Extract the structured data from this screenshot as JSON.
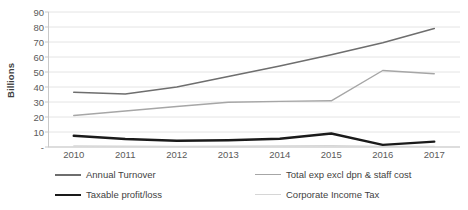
{
  "chart_data": {
    "type": "line",
    "title": "",
    "xlabel": "",
    "ylabel": "Billions",
    "ylim": [
      0,
      90
    ],
    "ytick_step": 10,
    "grid": true,
    "legend_position": "bottom",
    "zero_tick_label": "-",
    "categories": [
      "2010",
      "2011",
      "2012",
      "2013",
      "2014",
      "2015",
      "2016",
      "2017"
    ],
    "yticks": [
      "90",
      "80",
      "70",
      "60",
      "50",
      "40",
      "30",
      "20",
      "10",
      "-"
    ],
    "series": [
      {
        "name": "Annual Turnover",
        "color": "#6e6e6e",
        "width": 1.6,
        "values": [
          36.5,
          35.3,
          40.0,
          47.0,
          54.0,
          61.5,
          69.5,
          79.0
        ]
      },
      {
        "name": "Total exp excl dpn & staff cost",
        "color": "#a6a6a6",
        "width": 1.4,
        "values": [
          21.0,
          24.0,
          27.0,
          29.8,
          30.4,
          30.8,
          51.0,
          48.8
        ]
      },
      {
        "name": "Taxable profit/loss",
        "color": "#1a1a1a",
        "width": 2.4,
        "values": [
          7.5,
          5.3,
          4.2,
          4.5,
          5.5,
          9.0,
          1.4,
          3.6
        ]
      },
      {
        "name": "Corporate Income Tax",
        "color": "#d6d6d6",
        "width": 1.2,
        "values": [
          0.7,
          0.6,
          0.5,
          0.6,
          0.7,
          0.9,
          0.4,
          0.5
        ]
      }
    ]
  },
  "legend": {
    "items": [
      {
        "label": "Annual Turnover"
      },
      {
        "label": "Total exp excl dpn & staff cost"
      },
      {
        "label": "Taxable profit/loss"
      },
      {
        "label": "Corporate Income Tax"
      }
    ]
  },
  "colors": {
    "grid": "#e4e4e4",
    "axis": "#c9c9c9",
    "text": "#5a5a5a",
    "background": "#ffffff"
  }
}
